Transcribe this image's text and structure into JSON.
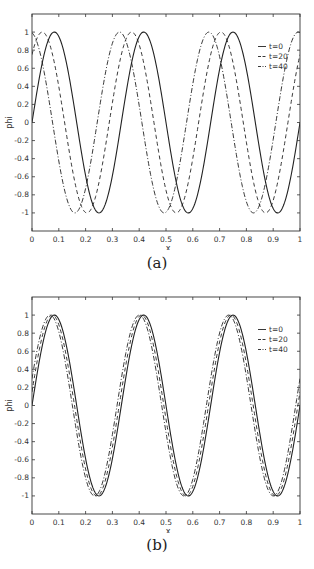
{
  "chart_data": [
    {
      "type": "line",
      "panel": "(a)",
      "xlabel": "x",
      "ylabel": "phi",
      "xlim": [
        0,
        1
      ],
      "ylim": [
        -1.2,
        1.2
      ],
      "xticks": [
        "0",
        "0.1",
        "0.2",
        "0.3",
        "0.4",
        "0.5",
        "0.6",
        "0.7",
        "0.8",
        "0.9",
        "1"
      ],
      "yticks": [
        "1",
        "0.8",
        "0.6",
        "0.4",
        "0.2",
        "0",
        "-0.2",
        "-0.4",
        "-0.6",
        "-0.8",
        "-1"
      ],
      "legend_position": "upper right",
      "series": [
        {
          "name": "t=0",
          "style": "solid",
          "formula": "sin(6*pi*(x - 0))",
          "shift": 0.0,
          "peaks_x": [
            0.083,
            0.417,
            0.75
          ],
          "troughs_x": [
            0.25,
            0.583,
            0.917
          ]
        },
        {
          "name": "t=20",
          "style": "dashed",
          "formula": "sin(6*pi*(x + 0.045))",
          "shift": -0.045,
          "peaks_x": [
            0.038,
            0.372,
            0.705
          ],
          "troughs_x": [
            0.205,
            0.538,
            0.872
          ]
        },
        {
          "name": "t=40",
          "style": "dashdot",
          "formula": "sin(6*pi*(x + 0.09))",
          "shift": -0.09,
          "peaks_x": [
            0.0,
            0.327,
            0.66,
            0.993
          ],
          "troughs_x": [
            0.16,
            0.493,
            0.827
          ]
        }
      ]
    },
    {
      "type": "line",
      "panel": "(b)",
      "xlabel": "x",
      "ylabel": "phi",
      "xlim": [
        0,
        1
      ],
      "ylim": [
        -1.2,
        1.2
      ],
      "xticks": [
        "0",
        "0.1",
        "0.2",
        "0.3",
        "0.4",
        "0.5",
        "0.6",
        "0.7",
        "0.8",
        "0.9",
        "1"
      ],
      "yticks": [
        "1",
        "0.8",
        "0.6",
        "0.4",
        "0.2",
        "0",
        "-0.2",
        "-0.4",
        "-0.6",
        "-0.8",
        "-1"
      ],
      "legend_position": "upper right",
      "series": [
        {
          "name": "t=0",
          "style": "solid",
          "formula": "sin(6*pi*(x - 0))",
          "shift": 0.0
        },
        {
          "name": "t=20",
          "style": "dashed",
          "formula": "sin(6*pi*(x + 0.008))",
          "shift": -0.008
        },
        {
          "name": "t=40",
          "style": "dashdot",
          "formula": "sin(6*pi*(x + 0.016))",
          "shift": -0.016
        }
      ]
    }
  ],
  "panels": [
    {
      "caption": "(a)",
      "xlabel": "x",
      "ylabel": "phi",
      "legend": [
        "t=0",
        "t=20",
        "t=40"
      ]
    },
    {
      "caption": "(b)",
      "xlabel": "x",
      "ylabel": "phi",
      "legend": [
        "t=0",
        "t=20",
        "t=40"
      ]
    }
  ]
}
